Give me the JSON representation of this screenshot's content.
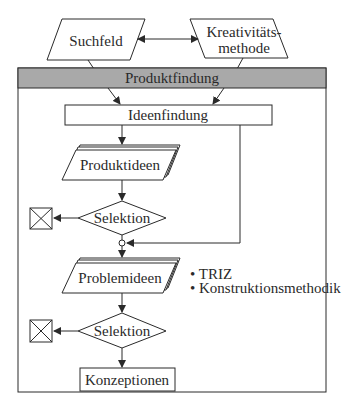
{
  "diagram": {
    "inputs": [
      {
        "label": "Suchfeld"
      },
      {
        "label_line1": "Kreativitäts-",
        "label_line2": "methode"
      }
    ],
    "frame": {
      "title": "Produktfindung",
      "header_color": "#a9a9a9"
    },
    "steps": {
      "ideenfindung": "Ideenfindung",
      "produktideen": "Produktideen",
      "selektion1": "Selektion",
      "problemideen": "Problemideen",
      "selektion2": "Selektion",
      "konzeptionen": "Konzeptionen"
    },
    "methods": [
      "• TRIZ",
      "• Konstruktionsmethodik"
    ],
    "colors": {
      "line": "#2a2a2a",
      "background": "#ffffff"
    }
  }
}
